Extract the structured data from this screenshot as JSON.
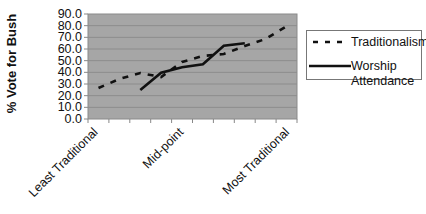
{
  "chart_data": {
    "type": "line",
    "title": "",
    "xlabel": "",
    "ylabel": "% Vote for Bush",
    "ylim": [
      0,
      90
    ],
    "yticks": [
      "0.0",
      "10.0",
      "20.0",
      "30.0",
      "40.0",
      "50.0",
      "60.0",
      "70.0",
      "80.0",
      "90.0"
    ],
    "x_category_count": 10,
    "x_tick_labels": [
      {
        "index": 0,
        "label": "Least Traditional"
      },
      {
        "index": 4,
        "label": "Mid-point"
      },
      {
        "index": 9,
        "label": "Most Traditional"
      }
    ],
    "grid": true,
    "legend_position": "right",
    "plot_background": "#a6a6a6",
    "series": [
      {
        "name": "Traditionalism",
        "style": "dashed",
        "values": [
          26.6,
          34.3,
          39.4,
          36.0,
          48.9,
          54.0,
          55.7,
          62.6,
          68.6,
          79.5
        ]
      },
      {
        "name": "Worship Attendance",
        "style": "solid",
        "values": [
          null,
          null,
          24.9,
          39.7,
          44.3,
          46.9,
          62.8,
          64.9,
          null,
          null
        ]
      }
    ]
  },
  "axis": {
    "ylabel": "% Vote for Bush",
    "yticks": [
      "90.0",
      "80.0",
      "70.0",
      "60.0",
      "50.0",
      "40.0",
      "30.0",
      "20.0",
      "10.0",
      "0.0"
    ],
    "xlabels": [
      "Least Traditional",
      "Mid-point",
      "Most Traditional"
    ]
  },
  "legend": {
    "items": [
      {
        "label": "Traditionalism"
      },
      {
        "label_line1": "Worship",
        "label_line2": "Attendance"
      }
    ]
  }
}
